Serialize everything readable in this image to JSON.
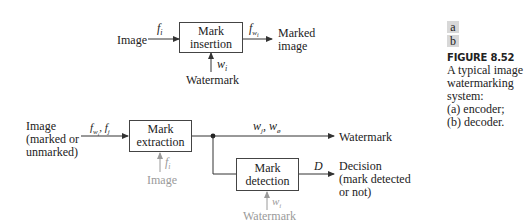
{
  "figure": {
    "panel_tags": [
      "a",
      "b"
    ],
    "title": "FIGURE 8.52",
    "caption_lines": [
      "A typical image",
      "watermarking",
      "system:",
      "(a) encoder;",
      "(b) decoder."
    ]
  },
  "encoder": {
    "input_label": "Image",
    "input_signal": "f_i",
    "input_signal_base": "f",
    "input_signal_sub": "i",
    "block_label_line1": "Mark",
    "block_label_line2": "insertion",
    "output_signal_base": "f",
    "output_signal_sub": "w_i",
    "output_label_line1": "Marked",
    "output_label_line2": "image",
    "watermark_signal_base": "w",
    "watermark_signal_sub": "i",
    "watermark_label": "Watermark"
  },
  "decoder": {
    "input_label_lines": [
      "Image",
      "(marked or",
      "unmarked)"
    ],
    "input_signal": "f_wi, f_j",
    "extraction_block_line1": "Mark",
    "extraction_block_line2": "extraction",
    "extraction_aux_signal_base": "f",
    "extraction_aux_signal_sub": "i",
    "extraction_aux_label": "Image",
    "extracted_signal": "w_j, w_o",
    "extracted_output_label": "Watermark",
    "detection_block_line1": "Mark",
    "detection_block_line2": "detection",
    "detection_output_signal": "D",
    "detection_output_lines": [
      "Decision",
      "(mark detected",
      "or not)"
    ],
    "detection_aux_signal_base": "w",
    "detection_aux_signal_sub": "i",
    "detection_aux_label": "Watermark"
  },
  "colors": {
    "line": "#333333",
    "optional_input": "#9a9a9a",
    "panel_tag_bg": "#d8d8d8"
  }
}
